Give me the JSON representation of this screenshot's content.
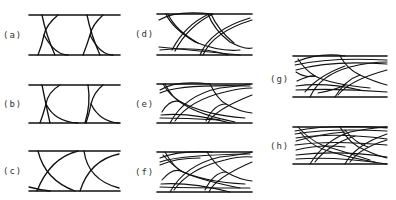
{
  "figure": {
    "panels": [
      {
        "id": "a",
        "label": "(a)",
        "x": 29,
        "y_top": 15,
        "y_bottom": 55,
        "width": 91,
        "traces": 1,
        "label_x": 3,
        "label_y": 30
      },
      {
        "id": "b",
        "label": "(b)",
        "x": 29,
        "y_top": 85,
        "y_bottom": 123,
        "width": 91,
        "traces": 1,
        "label_x": 3,
        "label_y": 99
      },
      {
        "id": "c",
        "label": "(c)",
        "x": 29,
        "y_top": 151,
        "y_bottom": 191,
        "width": 91,
        "traces": 1,
        "label_x": 3,
        "label_y": 166
      },
      {
        "id": "d",
        "label": "(d)",
        "x": 157,
        "y_top": 14,
        "y_bottom": 55,
        "width": 95,
        "traces": 2,
        "label_x": 135,
        "label_y": 29
      },
      {
        "id": "e",
        "label": "(e)",
        "x": 157,
        "y_top": 84,
        "y_bottom": 123,
        "width": 95,
        "traces": 3,
        "label_x": 135,
        "label_y": 99
      },
      {
        "id": "f",
        "label": "(f)",
        "x": 157,
        "y_top": 152,
        "y_bottom": 192,
        "width": 95,
        "traces": 4,
        "label_x": 135,
        "label_y": 167
      },
      {
        "id": "g",
        "label": "(g)",
        "x": 293,
        "y_top": 56,
        "y_bottom": 97,
        "width": 94,
        "traces": 5,
        "label_x": 270,
        "label_y": 74
      },
      {
        "id": "h",
        "label": "(h)",
        "x": 293,
        "y_top": 127,
        "y_bottom": 164,
        "width": 94,
        "traces": 6,
        "label_x": 270,
        "label_y": 141
      }
    ],
    "line_color": "#111111",
    "label_color": "#333333"
  }
}
